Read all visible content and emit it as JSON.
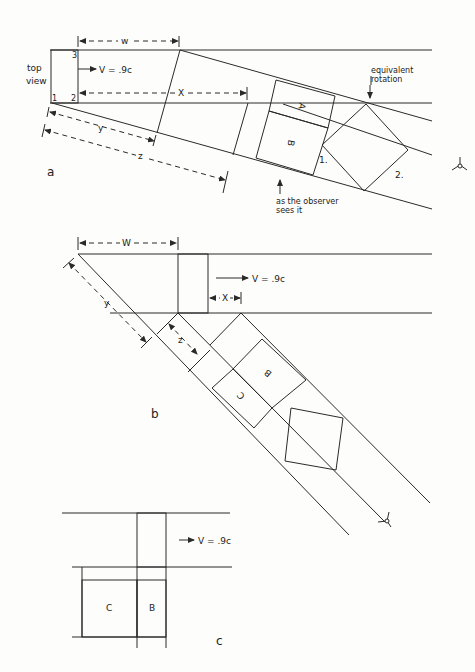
{
  "panel_a": {
    "label": "a",
    "top_view": [
      "top",
      "view"
    ],
    "velocity": "V = .9c",
    "dims": {
      "w": "w",
      "x": "X",
      "y": "y",
      "z": "z"
    },
    "corner_labels": [
      "1",
      "2",
      "3"
    ],
    "face_labels": {
      "A": "A",
      "B": "B"
    },
    "position_labels": [
      "1.",
      "2."
    ],
    "annotation_top": [
      "equivalent",
      "rotation"
    ],
    "annotation_bottom": [
      "as the observer",
      "sees it"
    ]
  },
  "panel_b": {
    "label": "b",
    "velocity": "V = .9c",
    "dims": {
      "w": "W",
      "x": "X",
      "y": "y",
      "z": "z"
    },
    "face_labels": {
      "B": "B",
      "C": "C"
    }
  },
  "panel_c": {
    "label": "c",
    "velocity": "V = .9c",
    "face_labels": {
      "C": "C",
      "B": "B"
    }
  },
  "observer_icon": "eye-observer-icon"
}
